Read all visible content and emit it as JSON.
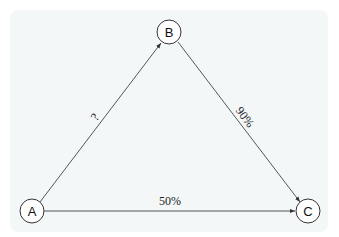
{
  "diagram": {
    "colors": {
      "panel_background": "#f3f7f8",
      "node_fill": "#ffffff",
      "node_stroke": "#333333",
      "edge_stroke": "#444444",
      "text": "#111111"
    },
    "nodes": [
      {
        "id": "A",
        "label": "A"
      },
      {
        "id": "B",
        "label": "B"
      },
      {
        "id": "C",
        "label": "C"
      }
    ],
    "edges": [
      {
        "from": "A",
        "to": "B",
        "label": "?"
      },
      {
        "from": "B",
        "to": "C",
        "label": "90%"
      },
      {
        "from": "A",
        "to": "C",
        "label": "50%"
      }
    ]
  }
}
